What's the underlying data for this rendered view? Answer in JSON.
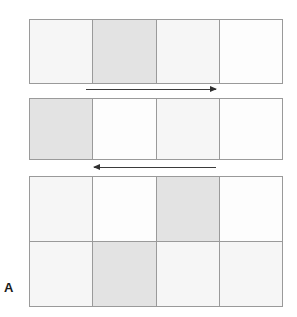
{
  "figure": {
    "panel_label": "A",
    "colors": {
      "border": "#9a9a9a",
      "cell_white": "#fdfdfd",
      "cell_tint": "#f6f6f6",
      "cell_shaded": "#e3e3e3",
      "arrow": "#3b3b3b",
      "background": "#ffffff"
    },
    "grids": [
      {
        "id": "strip-one",
        "name": "top-strip",
        "rows": 1,
        "columns": 4,
        "cells": [
          [
            {
              "index": 1,
              "tone": "tint"
            },
            {
              "index": 2,
              "tone": "shaded"
            },
            {
              "index": 3,
              "tone": "tint"
            },
            {
              "index": 4,
              "tone": "white"
            }
          ]
        ]
      },
      {
        "id": "strip-two",
        "name": "middle-strip",
        "rows": 1,
        "columns": 4,
        "cells": [
          [
            {
              "index": 1,
              "tone": "shaded"
            },
            {
              "index": 2,
              "tone": "white"
            },
            {
              "index": 3,
              "tone": "tint"
            },
            {
              "index": 4,
              "tone": "white"
            }
          ]
        ]
      },
      {
        "id": "block-three",
        "name": "bottom-block",
        "rows": 2,
        "columns": 4,
        "cells": [
          [
            {
              "index": 1,
              "tone": "tint"
            },
            {
              "index": 2,
              "tone": "white"
            },
            {
              "index": 3,
              "tone": "shaded"
            },
            {
              "index": 4,
              "tone": "white"
            }
          ],
          [
            {
              "index": 1,
              "tone": "tint"
            },
            {
              "index": 2,
              "tone": "shaded"
            },
            {
              "index": 3,
              "tone": "tint"
            },
            {
              "index": 4,
              "tone": "tint"
            }
          ]
        ]
      }
    ],
    "arrows": [
      {
        "id": "arrow-forward",
        "name": "rightward-arrow",
        "direction": "right"
      },
      {
        "id": "arrow-backward",
        "name": "leftward-arrow",
        "direction": "left"
      }
    ]
  }
}
